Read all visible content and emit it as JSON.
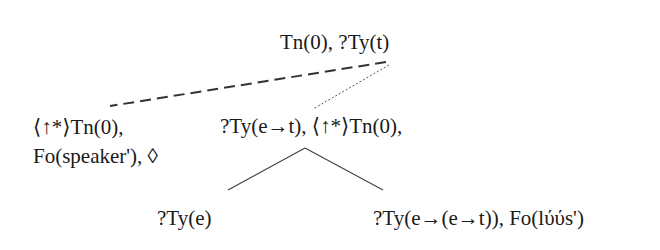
{
  "diagram": {
    "type": "tree",
    "nodes": {
      "root": {
        "lines": [
          "Tn(0), ?Ty(t)"
        ]
      },
      "left": {
        "lines": [
          "⟨↑*⟩Tn(0),",
          "Fo(speaker'), ◊"
        ]
      },
      "middle": {
        "lines": [
          "?Ty(e→t), ⟨↑*⟩Tn(0),"
        ]
      },
      "bottom_left": {
        "lines": [
          "?Ty(e)"
        ]
      },
      "bottom_right": {
        "lines": [
          "?Ty(e→(e→t)), Fo(lύύs')"
        ]
      }
    },
    "edges": [
      {
        "from": "root",
        "to": "left",
        "style": "dashed"
      },
      {
        "from": "root",
        "to": "middle",
        "style": "dotted"
      },
      {
        "from": "middle",
        "to": "bottom_left",
        "style": "solid"
      },
      {
        "from": "middle",
        "to": "bottom_right",
        "style": "solid"
      }
    ],
    "colors": {
      "text": "#1a1a1a",
      "edge": "#444444",
      "background": "#ffffff"
    }
  }
}
